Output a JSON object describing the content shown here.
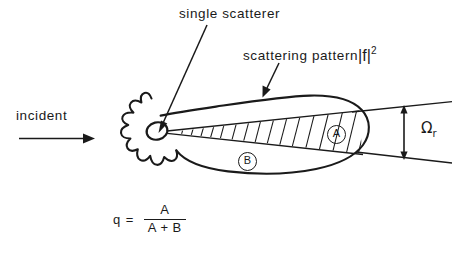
{
  "figure": {
    "background_color": "#ffffff",
    "ink_color": "#1a1a1a",
    "labels": {
      "single_scatterer": "single scatterer",
      "scattering_pattern_text": "scattering pattern",
      "scattering_pattern_modulus": "|f|",
      "scattering_pattern_exponent": "2",
      "incident": "incident",
      "omega_symbol": "Ω",
      "omega_subscript": "r",
      "region_a": "A",
      "region_b": "B"
    },
    "equation": {
      "lhs": "q",
      "equals": "=",
      "numerator": "A",
      "denominator": "A + B"
    },
    "icons": {
      "incident_arrow": "arrow-right-icon",
      "leader_single_scatterer": "leader-line-icon",
      "leader_scattering_pattern": "leader-line-icon",
      "omega_extent_arrow": "double-headed-arrow-icon"
    },
    "shapes": {
      "scatterer_blob": "star-blob-shape",
      "single_scatterer_dot": "small-ellipse-shape",
      "scattering_lobe": "teardrop-lobe-shape",
      "detector_cone": "hatched-cone-shape",
      "cone_guide_lines": "cone-aperture-lines"
    }
  }
}
